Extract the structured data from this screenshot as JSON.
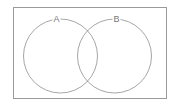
{
  "diagram": {
    "type": "venn",
    "universe": {
      "x": 13,
      "y": 7,
      "width": 153,
      "height": 91,
      "stroke": "#9a9a9a"
    },
    "sets": [
      {
        "label": "A",
        "cx": 60.5,
        "cy": 56,
        "r": 37,
        "label_x": 56.5,
        "label_y": 20
      },
      {
        "label": "B",
        "cx": 114.5,
        "cy": 56,
        "r": 37,
        "label_x": 116.5,
        "label_y": 20
      }
    ],
    "circle_stroke": "#8f8f8f",
    "label_bg": "#ffffff"
  }
}
